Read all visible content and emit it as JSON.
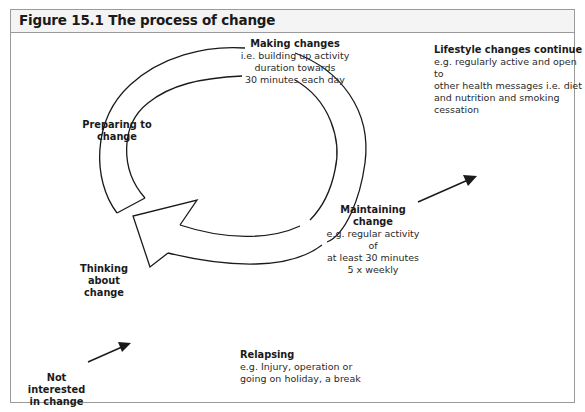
{
  "figure": {
    "title": "Figure 15.1 The process of change"
  },
  "stages": {
    "making_changes": {
      "heading": "Making changes",
      "lines": [
        "i.e. building up activity",
        "duration towards",
        "30 minutes each day"
      ]
    },
    "lifestyle_changes": {
      "heading": "Lifestyle changes continue",
      "lines": [
        "e.g. regularly active and open to",
        "other health messages i.e. diet",
        "and nutrition and smoking",
        "cessation"
      ]
    },
    "preparing": {
      "heading_lines": [
        "Preparing to",
        "change"
      ]
    },
    "maintaining": {
      "heading": "Maintaining change",
      "lines": [
        "e.g. regular activity of",
        "at least 30 minutes",
        "5 x weekly"
      ]
    },
    "thinking": {
      "heading_lines": [
        "Thinking about",
        "change"
      ]
    },
    "not_interested": {
      "heading_lines": [
        "Not interested",
        "in change"
      ]
    },
    "relapsing": {
      "heading": "Relapsing",
      "lines": [
        "e.g. Injury, operation or",
        "going on holiday, a break"
      ]
    }
  },
  "colors": {
    "stroke": "#1a1a1a",
    "border": "#9a9a9a",
    "title_bg": "#f4f4f4"
  }
}
